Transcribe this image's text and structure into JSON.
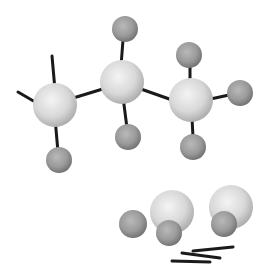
{
  "diagram": {
    "type": "ball-and-stick molecular model",
    "background": "#ffffff",
    "colors": {
      "carbon_light": "#f4f4f4",
      "carbon_mid": "#d8d8d8",
      "carbon_dark": "#a9a9a9",
      "hydrogen_light": "#b9b9b9",
      "hydrogen_mid": "#9a9a9a",
      "hydrogen_dark": "#6f6f6f",
      "bond": "#1a1a1a"
    },
    "molecule": {
      "atoms": [
        {
          "id": "C1",
          "element": "carbon",
          "x": 55,
          "y": 105,
          "r": 22
        },
        {
          "id": "C2",
          "element": "carbon",
          "x": 122,
          "y": 82,
          "r": 22
        },
        {
          "id": "C3",
          "element": "carbon",
          "x": 191,
          "y": 100,
          "r": 22
        },
        {
          "id": "H1",
          "element": "hydrogen",
          "x": 59,
          "y": 160,
          "r": 13
        },
        {
          "id": "H2",
          "element": "hydrogen",
          "x": 125,
          "y": 29,
          "r": 13
        },
        {
          "id": "H3",
          "element": "hydrogen",
          "x": 128,
          "y": 137,
          "r": 13
        },
        {
          "id": "H4",
          "element": "hydrogen",
          "x": 189,
          "y": 55,
          "r": 13
        },
        {
          "id": "H5",
          "element": "hydrogen",
          "x": 240,
          "y": 93,
          "r": 13
        },
        {
          "id": "H6",
          "element": "hydrogen",
          "x": 193,
          "y": 147,
          "r": 13
        }
      ],
      "bonds": [
        {
          "x1": 52,
          "y1": 56,
          "x2": 55,
          "y2": 90
        },
        {
          "x1": 18,
          "y1": 92,
          "x2": 42,
          "y2": 106
        },
        {
          "x1": 70,
          "y1": 99,
          "x2": 106,
          "y2": 88
        },
        {
          "x1": 55,
          "y1": 118,
          "x2": 58,
          "y2": 152
        },
        {
          "x1": 123,
          "y1": 40,
          "x2": 121,
          "y2": 66
        },
        {
          "x1": 123,
          "y1": 97,
          "x2": 127,
          "y2": 128
        },
        {
          "x1": 138,
          "y1": 88,
          "x2": 175,
          "y2": 101
        },
        {
          "x1": 190,
          "y1": 66,
          "x2": 190,
          "y2": 82
        },
        {
          "x1": 206,
          "y1": 100,
          "x2": 229,
          "y2": 95
        },
        {
          "x1": 192,
          "y1": 118,
          "x2": 193,
          "y2": 137
        }
      ]
    },
    "loose_parts": {
      "atoms": [
        {
          "id": "C4",
          "element": "carbon",
          "x": 172,
          "y": 212,
          "r": 22
        },
        {
          "id": "C5",
          "element": "carbon",
          "x": 231,
          "y": 207,
          "r": 22
        },
        {
          "id": "H7",
          "element": "hydrogen",
          "x": 133,
          "y": 224,
          "r": 14
        },
        {
          "id": "H8",
          "element": "hydrogen",
          "x": 169,
          "y": 233,
          "r": 13
        },
        {
          "id": "H9",
          "element": "hydrogen",
          "x": 224,
          "y": 224,
          "r": 13
        }
      ],
      "sticks": [
        {
          "x1": 193,
          "y1": 251,
          "x2": 233,
          "y2": 247
        },
        {
          "x1": 182,
          "y1": 253,
          "x2": 220,
          "y2": 258
        },
        {
          "x1": 172,
          "y1": 261,
          "x2": 210,
          "y2": 262
        }
      ]
    }
  }
}
